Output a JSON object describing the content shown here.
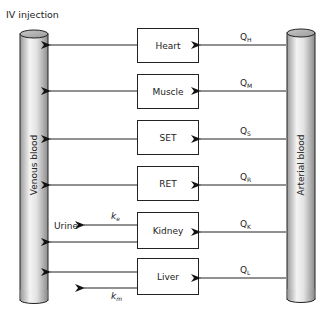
{
  "title": "IV injection",
  "venous": {
    "label": "Venous blood"
  },
  "arterial": {
    "label": "Arterial blood"
  },
  "organs": [
    {
      "name": "Heart",
      "flow": "Q",
      "flow_sub": "H"
    },
    {
      "name": "Muscle",
      "flow": "Q",
      "flow_sub": "M"
    },
    {
      "name": "SET",
      "flow": "Q",
      "flow_sub": "S"
    },
    {
      "name": "RET",
      "flow": "Q",
      "flow_sub": "R"
    },
    {
      "name": "Kidney",
      "flow": "Q",
      "flow_sub": "K"
    },
    {
      "name": "Liver",
      "flow": "Q",
      "flow_sub": "L"
    }
  ],
  "elimination": {
    "urine_label": "Urine",
    "renal_rate": "k",
    "renal_rate_sub": "e",
    "metabolic_rate": "k",
    "metabolic_rate_sub": "m"
  }
}
